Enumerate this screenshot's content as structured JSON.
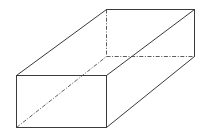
{
  "diagram": {
    "type": "rectangular-prism-wireframe",
    "colors": {
      "edge": "#3a3a3a",
      "hidden_edge": "#4a4a4a",
      "background": "#ffffff"
    },
    "vertices": {
      "front_top_left": [
        16,
        75
      ],
      "front_top_right": [
        106,
        75
      ],
      "front_bottom_right": [
        106,
        127
      ],
      "front_bottom_left": [
        16,
        127
      ],
      "back_top_left": [
        106,
        9
      ],
      "back_top_right": [
        194,
        9
      ],
      "back_bottom_right": [
        194,
        56
      ],
      "back_bottom_left": [
        106,
        56
      ]
    },
    "visible_edges": [
      [
        "front_top_left",
        "front_top_right"
      ],
      [
        "front_top_right",
        "front_bottom_right"
      ],
      [
        "front_bottom_right",
        "front_bottom_left"
      ],
      [
        "front_bottom_left",
        "front_top_left"
      ],
      [
        "front_top_left",
        "back_top_left"
      ],
      [
        "back_top_left",
        "back_top_right"
      ],
      [
        "back_top_right",
        "back_bottom_right"
      ],
      [
        "front_top_right",
        "back_top_right"
      ],
      [
        "front_bottom_right",
        "back_bottom_right"
      ]
    ],
    "hidden_edges": [
      [
        "back_top_left",
        "back_bottom_left"
      ],
      [
        "back_bottom_left",
        "back_bottom_right"
      ],
      [
        "front_bottom_left",
        "back_bottom_left"
      ]
    ]
  }
}
